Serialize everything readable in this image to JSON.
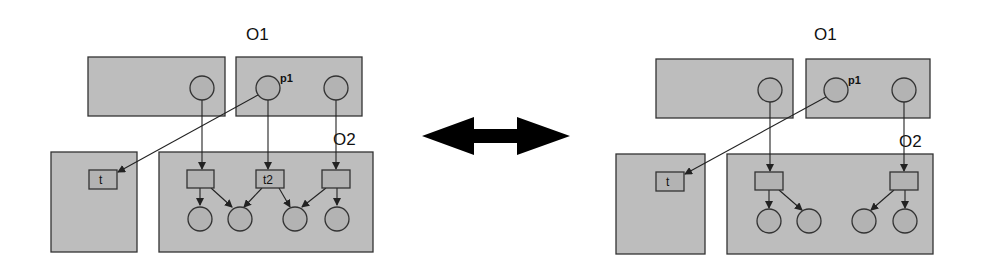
{
  "diagram": {
    "type": "petri-net-object-refactoring",
    "relation_arrow": "bidirectional",
    "colors": {
      "box_fill": "#bdbdbd",
      "node_fill": "#b3b3b3",
      "stroke": "#333333",
      "arrow": "#000000"
    },
    "left": {
      "labels": {
        "o1": "O1",
        "o2": "O2",
        "p1": "p1",
        "t": "t",
        "t2": "t2"
      },
      "boxes": [
        "top-left",
        "O1",
        "bottom-left",
        "O2"
      ],
      "top_places": 3,
      "transitions": 3,
      "bottom_places": 4
    },
    "right": {
      "labels": {
        "o1": "O1",
        "o2": "O2",
        "p1": "p1",
        "t": "t"
      },
      "boxes": [
        "top-left",
        "O1",
        "bottom-left",
        "O2"
      ],
      "top_places": 3,
      "transitions": 2,
      "bottom_places": 4
    }
  }
}
